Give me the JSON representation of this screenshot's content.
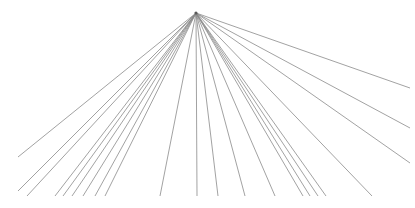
{
  "figure": {
    "type": "line-art",
    "width": 415,
    "height": 208,
    "background_color": "#ffffff",
    "line_color": "#8a8a8a",
    "line_width": 0.8,
    "apex": {
      "x": 196,
      "y": 13
    },
    "line_count": 21
  },
  "chart_data": {
    "type": "line",
    "subtitle": "",
    "xlabel": "",
    "ylabel": "",
    "xlim": [
      0,
      415
    ],
    "ylim": [
      0,
      208
    ],
    "grid": false,
    "legend": "none",
    "origin": {
      "x": 196,
      "y": 13
    },
    "stroke_color": "#8a8a8a",
    "stroke_width": 0.8,
    "background": "#ffffff",
    "annotations": [],
    "series": [
      {
        "name": "ray-01",
        "x": [
          196,
          18
        ],
        "y": [
          13,
          157
        ]
      },
      {
        "name": "ray-02",
        "x": [
          196,
          18
        ],
        "y": [
          13,
          191
        ]
      },
      {
        "name": "ray-03",
        "x": [
          196,
          27
        ],
        "y": [
          13,
          196
        ]
      },
      {
        "name": "ray-04",
        "x": [
          196,
          55
        ],
        "y": [
          13,
          196
        ]
      },
      {
        "name": "ray-05",
        "x": [
          196,
          63
        ],
        "y": [
          13,
          196
        ]
      },
      {
        "name": "ray-06",
        "x": [
          196,
          72
        ],
        "y": [
          13,
          196
        ]
      },
      {
        "name": "ray-07",
        "x": [
          196,
          83
        ],
        "y": [
          13,
          196
        ]
      },
      {
        "name": "ray-08",
        "x": [
          196,
          95
        ],
        "y": [
          13,
          196
        ]
      },
      {
        "name": "ray-09",
        "x": [
          196,
          105
        ],
        "y": [
          13,
          196
        ]
      },
      {
        "name": "ray-10",
        "x": [
          196,
          160
        ],
        "y": [
          13,
          196
        ]
      },
      {
        "name": "ray-11",
        "x": [
          196,
          197
        ],
        "y": [
          13,
          196
        ]
      },
      {
        "name": "ray-12",
        "x": [
          196,
          218
        ],
        "y": [
          13,
          196
        ]
      },
      {
        "name": "ray-13",
        "x": [
          196,
          245
        ],
        "y": [
          13,
          196
        ]
      },
      {
        "name": "ray-14",
        "x": [
          196,
          275
        ],
        "y": [
          13,
          196
        ]
      },
      {
        "name": "ray-15",
        "x": [
          196,
          303
        ],
        "y": [
          13,
          196
        ]
      },
      {
        "name": "ray-16",
        "x": [
          196,
          310
        ],
        "y": [
          13,
          196
        ]
      },
      {
        "name": "ray-17",
        "x": [
          196,
          318
        ],
        "y": [
          13,
          196
        ]
      },
      {
        "name": "ray-18",
        "x": [
          196,
          326
        ],
        "y": [
          13,
          196
        ]
      },
      {
        "name": "ray-19",
        "x": [
          196,
          372
        ],
        "y": [
          13,
          196
        ]
      },
      {
        "name": "ray-20",
        "x": [
          196,
          410
        ],
        "y": [
          13,
          88
        ]
      },
      {
        "name": "ray-21",
        "x": [
          196,
          410
        ],
        "y": [
          13,
          128
        ]
      },
      {
        "name": "ray-22",
        "x": [
          196,
          410
        ],
        "y": [
          13,
          163
        ]
      }
    ]
  }
}
